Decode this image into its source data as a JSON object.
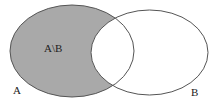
{
  "diagram": {
    "type": "venn",
    "sets": [
      {
        "name": "A",
        "label": "A",
        "cx": 72,
        "cy": 51,
        "rx": 62,
        "ry": 46
      },
      {
        "name": "B",
        "label": "B",
        "cx": 149.5,
        "cy": 52.5,
        "rx": 58.5,
        "ry": 42.5
      }
    ],
    "shaded_region": {
      "label": "A\\B",
      "fill": "#a9a9a9"
    },
    "stroke_color": "#555555",
    "background": "#ffffff"
  }
}
